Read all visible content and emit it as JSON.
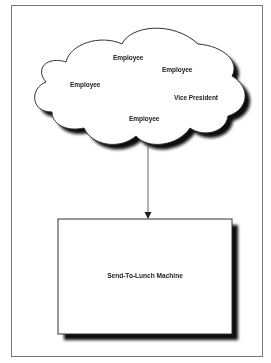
{
  "diagram": {
    "cloud": {
      "nodes": [
        {
          "id": "employee-1",
          "label": "Employee"
        },
        {
          "id": "employee-2",
          "label": "Employee"
        },
        {
          "id": "employee-3",
          "label": "Employee"
        },
        {
          "id": "vice-president",
          "label": "Vice President"
        },
        {
          "id": "employee-4",
          "label": "Employee"
        }
      ]
    },
    "box": {
      "label": "Send-To-Lunch Machine"
    },
    "edges": [
      {
        "from": "cloud",
        "to": "box",
        "type": "arrow"
      }
    ],
    "colors": {
      "stroke": "#333333",
      "shadow": "#111111",
      "fill": "#ffffff",
      "frame": "#777777"
    }
  }
}
